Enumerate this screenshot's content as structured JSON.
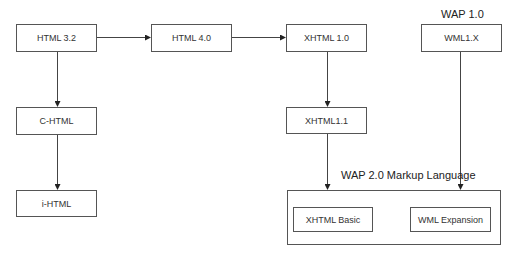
{
  "diagram": {
    "nodes": {
      "html32": {
        "label": "HTML 3.2"
      },
      "html40": {
        "label": "HTML 4.0"
      },
      "xhtml10": {
        "label": "XHTML 1.0"
      },
      "wml1x": {
        "label": "WML1.X"
      },
      "chtml": {
        "label": "C-HTML"
      },
      "xhtml11": {
        "label": "XHTML1.1"
      },
      "ihtml": {
        "label": "i-HTML"
      },
      "xhtmlbasic": {
        "label": "XHTML Basic"
      },
      "wmlexpansion": {
        "label": "WML Expansion"
      }
    },
    "groups": {
      "wap10": {
        "label": "WAP 1.0"
      },
      "wap20": {
        "label": "WAP 2.0 Markup Language"
      }
    },
    "edges": [
      {
        "from": "HTML 3.2",
        "to": "HTML 4.0"
      },
      {
        "from": "HTML 4.0",
        "to": "XHTML 1.0"
      },
      {
        "from": "HTML 3.2",
        "to": "C-HTML"
      },
      {
        "from": "C-HTML",
        "to": "i-HTML"
      },
      {
        "from": "XHTML 1.0",
        "to": "XHTML1.1"
      },
      {
        "from": "XHTML1.1",
        "to": "WAP 2.0 Markup Language"
      },
      {
        "from": "WML1.X",
        "to": "WAP 2.0 Markup Language"
      }
    ],
    "colors": {
      "line": "#444444",
      "border": "#555555",
      "background": "#ffffff"
    }
  }
}
